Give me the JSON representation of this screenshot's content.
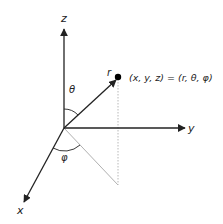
{
  "diagram": {
    "axes": {
      "z_label": "z",
      "y_label": "y",
      "x_label": "x"
    },
    "vector_label": "r",
    "point_equation": "(x, y, z) = (r, θ, φ)",
    "polar_angle_label": "θ",
    "azimuth_angle_label": "φ",
    "colors": {
      "axis": "#222222",
      "projection": "#b0b0b0",
      "dotted": "#b8b8b8",
      "point": "#000000"
    }
  }
}
